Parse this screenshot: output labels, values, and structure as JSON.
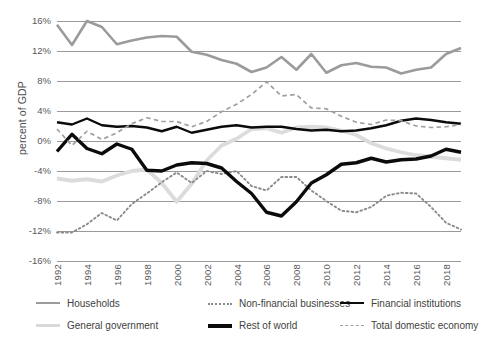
{
  "chart_data": {
    "type": "line",
    "title": "",
    "xlabel": "",
    "ylabel": "percent of GDP",
    "ylim": [
      -16,
      16
    ],
    "ytick_labels": [
      "16%",
      "12%",
      "8%",
      "4%",
      "0%",
      "-4%",
      "-8%",
      "-12%",
      "-16%"
    ],
    "ytick_values": [
      16,
      12,
      8,
      4,
      0,
      -4,
      -8,
      -12,
      -16
    ],
    "grid": "horizontal",
    "legend_position": "bottom",
    "x": [
      1992,
      1993,
      1994,
      1995,
      1996,
      1997,
      1998,
      1999,
      2000,
      2001,
      2002,
      2003,
      2004,
      2005,
      2006,
      2007,
      2008,
      2009,
      2010,
      2011,
      2012,
      2013,
      2014,
      2015,
      2016,
      2017,
      2018,
      2019
    ],
    "xtick_labels": [
      "1992",
      "1994",
      "1996",
      "1998",
      "2000",
      "2002",
      "2004",
      "2006",
      "2008",
      "2010",
      "2012",
      "2014",
      "2016",
      "2018"
    ],
    "series": [
      {
        "name": "Households",
        "color": "#9b9b9b",
        "style": "solid",
        "width": 2.6,
        "values": [
          15.5,
          12.8,
          16.0,
          15.2,
          12.9,
          13.4,
          13.8,
          14.0,
          13.9,
          11.9,
          11.5,
          10.8,
          10.3,
          9.2,
          9.8,
          11.2,
          9.5,
          11.6,
          9.1,
          10.1,
          10.4,
          9.9,
          9.8,
          9.0,
          9.5,
          9.8,
          11.6,
          12.4
        ]
      },
      {
        "name": "General government",
        "color": "#dcdcdc",
        "style": "solid",
        "width": 3.8,
        "values": [
          -5.0,
          -5.3,
          -5.1,
          -5.4,
          -4.6,
          -4.0,
          -3.8,
          -5.6,
          -8.1,
          -5.7,
          -2.6,
          -0.6,
          0.3,
          1.6,
          1.7,
          1.1,
          1.8,
          1.9,
          1.8,
          1.4,
          0.8,
          -0.3,
          -1.0,
          -1.5,
          -1.9,
          -2.1,
          -2.3,
          -2.5
        ]
      },
      {
        "name": "Non-financial businesses",
        "color": "#8b8b8b",
        "style": "dotted",
        "width": 1.9,
        "values": [
          -12.2,
          -12.2,
          -11.1,
          -9.6,
          -10.6,
          -8.4,
          -7.0,
          -5.5,
          -4.2,
          -5.6,
          -4.0,
          -4.4,
          -4.0,
          -6.0,
          -6.6,
          -4.8,
          -4.8,
          -6.6,
          -8.0,
          -9.3,
          -9.5,
          -8.8,
          -7.3,
          -6.9,
          -7.0,
          -8.8,
          -10.9,
          -11.8
        ]
      },
      {
        "name": "Rest of world",
        "color": "#0b0b0b",
        "style": "solid",
        "width": 3.4,
        "values": [
          -1.4,
          0.9,
          -1.0,
          -1.7,
          -0.4,
          -1.1,
          -3.9,
          -4.0,
          -3.2,
          -2.9,
          -3.0,
          -3.6,
          -5.4,
          -7.0,
          -9.5,
          -10.0,
          -8.1,
          -5.6,
          -4.5,
          -3.1,
          -2.9,
          -2.3,
          -2.8,
          -2.5,
          -2.4,
          -2.0,
          -1.1,
          -1.5
        ]
      },
      {
        "name": "Financial institutions",
        "color": "#0b0b0b",
        "style": "solid",
        "width": 2.4,
        "values": [
          2.5,
          2.2,
          3.0,
          2.1,
          1.9,
          2.0,
          1.8,
          1.3,
          1.9,
          1.1,
          1.5,
          1.9,
          2.1,
          1.8,
          1.9,
          1.9,
          1.6,
          1.4,
          1.5,
          1.3,
          1.4,
          1.7,
          2.1,
          2.7,
          3.0,
          2.8,
          2.5,
          2.3
        ]
      },
      {
        "name": "Total domestic economy",
        "color": "#9e9e9e",
        "style": "dashed",
        "width": 1.7,
        "values": [
          1.6,
          -0.6,
          1.3,
          0.2,
          1.1,
          2.3,
          3.1,
          2.6,
          2.6,
          1.9,
          2.6,
          3.9,
          4.9,
          6.2,
          7.9,
          6.0,
          6.2,
          4.4,
          4.3,
          3.3,
          2.5,
          2.2,
          2.8,
          2.7,
          2.0,
          1.8,
          1.9,
          2.2
        ]
      }
    ]
  },
  "legend": {
    "items": [
      {
        "label": "Households",
        "key": "households"
      },
      {
        "label": "Non-financial businesses",
        "key": "nonfin"
      },
      {
        "label": "Financial institutions",
        "key": "financial"
      },
      {
        "label": "General government",
        "key": "government"
      },
      {
        "label": "Rest of world",
        "key": "restofworld"
      },
      {
        "label": "Total domestic economy",
        "key": "totaldom"
      }
    ]
  }
}
